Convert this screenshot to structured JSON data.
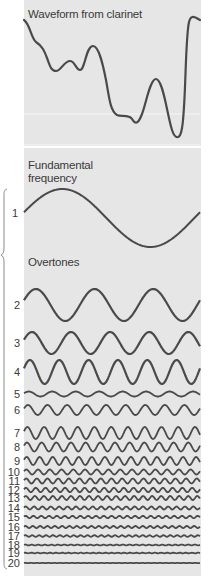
{
  "title": "Waveform from clarinet",
  "fundamental": {
    "label_line1": "Fundamental",
    "label_line2": "frequency",
    "harmonic_number": "1"
  },
  "overtones": {
    "label": "Overtones",
    "rows": [
      {
        "n": "2",
        "cycles": 3,
        "amplitude": 16,
        "y": 305
      },
      {
        "n": "3",
        "cycles": 4.5,
        "amplitude": 11,
        "y": 343
      },
      {
        "n": "4",
        "cycles": 6,
        "amplitude": 12,
        "y": 372
      },
      {
        "n": "5",
        "cycles": 7.5,
        "amplitude": 2.5,
        "y": 394
      },
      {
        "n": "6",
        "cycles": 9,
        "amplitude": 5,
        "y": 410
      },
      {
        "n": "7",
        "cycles": 10.5,
        "amplitude": 6,
        "y": 433
      },
      {
        "n": "8",
        "cycles": 12,
        "amplitude": 4.5,
        "y": 447
      },
      {
        "n": "9",
        "cycles": 13.5,
        "amplitude": 4,
        "y": 461
      },
      {
        "n": "10",
        "cycles": 15,
        "amplitude": 2.5,
        "y": 472
      },
      {
        "n": "11",
        "cycles": 16.5,
        "amplitude": 2.5,
        "y": 481
      },
      {
        "n": "12",
        "cycles": 18,
        "amplitude": 2.2,
        "y": 490
      },
      {
        "n": "13",
        "cycles": 19.5,
        "amplitude": 2,
        "y": 498
      },
      {
        "n": "14",
        "cycles": 21,
        "amplitude": 1.5,
        "y": 508
      },
      {
        "n": "15",
        "cycles": 22.5,
        "amplitude": 1.2,
        "y": 517
      },
      {
        "n": "16",
        "cycles": 24,
        "amplitude": 1,
        "y": 527
      },
      {
        "n": "17",
        "cycles": 25.5,
        "amplitude": 0.8,
        "y": 536
      },
      {
        "n": "18",
        "cycles": 27,
        "amplitude": 0.4,
        "y": 545
      },
      {
        "n": "19",
        "cycles": 28.5,
        "amplitude": 0.3,
        "y": 553
      },
      {
        "n": "20",
        "cycles": 30,
        "amplitude": 0.2,
        "y": 563
      }
    ]
  },
  "colors": {
    "panel_bg": "#e6e6e6",
    "wave_stroke": "#4a4a4a",
    "text": "#3a3a3a",
    "brace": "#8a8a8a"
  }
}
